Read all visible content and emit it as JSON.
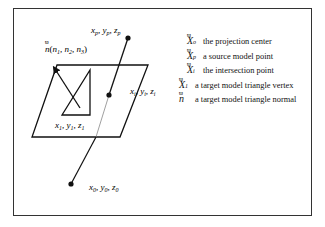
{
  "figure": {
    "type": "geometric diagram"
  },
  "labels": {
    "source_point": {
      "x": "x",
      "xs": "p",
      "y": "y",
      "ys": "p",
      "z": "z",
      "zs": "p"
    },
    "intersection": {
      "x": "x",
      "xs": "i",
      "y": "y",
      "ys": "i",
      "z": "z",
      "zs": "i"
    },
    "vertex": {
      "x": "x",
      "xs": "1",
      "y": "y",
      "ys": "1",
      "z": "z",
      "zs": "1"
    },
    "center": {
      "x": "x",
      "xs": "0",
      "y": "y",
      "ys": "0",
      "z": "z",
      "zs": "0"
    },
    "normal": {
      "n": "n",
      "n1": "n",
      "n1s": "1",
      "n2": "n",
      "n2s": "2",
      "n3": "n",
      "n3s": "3"
    }
  },
  "legend": [
    {
      "symbol": "X",
      "sub": "o",
      "text": "the projection center"
    },
    {
      "symbol": "X",
      "sub": "p",
      "text": "a source model point"
    },
    {
      "symbol": "X",
      "sub": "i",
      "text": "the intersection point"
    },
    {
      "symbol": "X",
      "sub": "1",
      "text": "a target model triangle vertex"
    },
    {
      "symbol": "n",
      "sub": "",
      "text": "a target model triangle normal"
    }
  ],
  "vector_mark": "ϖ"
}
